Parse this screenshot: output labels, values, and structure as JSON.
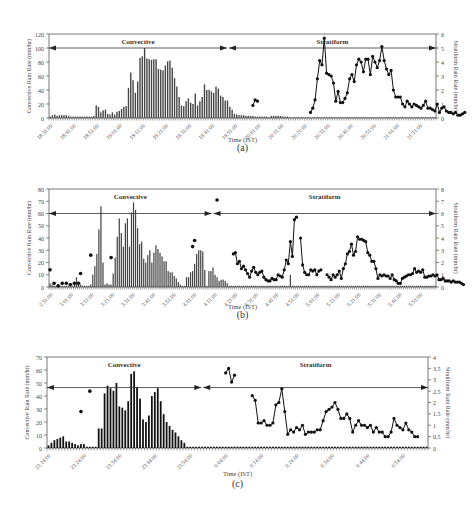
{
  "chart_data": [
    {
      "id": "a",
      "type": "bar+line",
      "panel_label": "(a)",
      "xlabel": "Time (IST)",
      "ylabel_left": "Convective Rain Rate (mm/hr)",
      "ylabel_right": "Stratiform Rain Rate (mm/hr)",
      "ylim_left": [
        0,
        120
      ],
      "yticks_left": [
        0,
        20,
        40,
        60,
        80,
        100,
        120
      ],
      "ylim_right": [
        0,
        6
      ],
      "yticks_right": [
        0,
        1,
        2,
        3,
        4,
        5,
        6
      ],
      "xtick_labels": [
        "18:31:00",
        "18:41:00",
        "18:51:00",
        "19:01:00",
        "19:11:00",
        "19:21:00",
        "19:31:00",
        "19:41:00",
        "19:51:00",
        "20:01:00",
        "20:11:00",
        "20:21:00",
        "20:31:00",
        "20:41:00",
        "20:51:00",
        "21:01:00",
        "21:11:00"
      ],
      "regions": [
        {
          "name": "Convective",
          "start_frac": 0.0,
          "end_frac": 0.46,
          "arrow_y": 100
        },
        {
          "name": "Stratiform",
          "start_frac": 0.465,
          "end_frac": 1.0,
          "arrow_y": 100
        }
      ],
      "convective_bars": [
        2,
        4,
        5,
        3,
        4,
        4,
        4,
        4,
        3,
        2,
        2,
        2,
        2,
        2,
        2,
        2,
        2,
        2,
        2,
        3,
        18,
        16,
        8,
        11,
        12,
        6,
        5,
        8,
        5,
        9,
        10,
        13,
        16,
        17,
        43,
        65,
        54,
        36,
        52,
        86,
        88,
        100,
        85,
        84,
        83,
        84,
        84,
        70,
        69,
        68,
        75,
        81,
        82,
        72,
        57,
        45,
        30,
        18,
        17,
        24,
        28,
        22,
        20,
        35,
        18,
        24,
        30,
        48,
        40,
        40,
        38,
        36,
        45,
        42,
        32,
        30,
        25,
        25,
        16,
        12,
        6,
        5,
        4,
        4,
        4,
        3,
        3,
        3,
        3,
        2,
        2,
        2,
        2,
        2,
        2,
        1,
        3,
        3,
        3,
        3,
        3,
        2,
        2,
        2,
        1,
        1,
        1,
        1,
        1,
        1,
        1,
        1,
        1,
        1,
        1,
        1,
        1,
        1,
        1,
        1,
        1,
        1,
        1,
        1,
        1,
        1,
        1,
        1,
        1,
        1,
        1,
        1,
        1,
        1,
        1,
        1,
        1,
        1,
        1,
        1,
        1,
        1,
        1,
        1,
        1,
        1,
        1,
        1,
        1,
        1,
        1,
        1,
        1,
        1,
        1,
        1,
        1,
        1,
        1,
        1,
        1,
        1,
        1,
        1,
        1,
        1,
        1,
        1
      ],
      "stratiform_line": {
        "start_index": 88,
        "values": [
          0.9,
          1.3,
          1.2,
          null,
          null,
          null,
          null,
          null,
          null,
          null,
          null,
          null,
          null,
          null,
          null,
          null,
          null,
          null,
          null,
          null,
          null,
          null,
          null,
          null,
          null,
          0.4,
          0.7,
          1.3,
          2.8,
          4.1,
          3.8,
          5.7,
          3.2,
          3.1,
          3.0,
          2.5,
          1.2,
          1.9,
          1.1,
          1.1,
          1.4,
          1.8,
          2.8,
          3.1,
          2.6,
          3.8,
          4.2,
          4.0,
          3.3,
          4.2,
          4.2,
          3.1,
          4.4,
          4.0,
          3.6,
          4.1,
          5.1,
          4.1,
          3.5,
          3.1,
          3.4,
          2.0,
          1.5,
          1.5,
          1.5,
          1.0,
          0.8,
          1.2,
          1.0,
          0.8,
          1.0,
          0.9,
          0.8,
          0.7,
          0.9,
          1.2,
          0.7,
          0.7,
          0.6,
          0.5,
          1.0,
          0.4,
          0.7,
          0.8,
          0.5,
          0.4,
          0.4,
          0.3,
          0.4,
          0.2,
          0.2,
          0.3,
          0.4
        ]
      }
    },
    {
      "id": "b",
      "type": "bar+line",
      "panel_label": "(b)",
      "xlabel": "Time (IST)",
      "ylabel_left": "Convective Rain Rate (mm/hr)",
      "ylabel_right": "Stratiform Rain Rate (mm/hr)",
      "ylim_left": [
        0,
        80
      ],
      "yticks_left": [
        0,
        10,
        20,
        30,
        40,
        50,
        60,
        70,
        80
      ],
      "ylim_right": [
        0,
        8
      ],
      "yticks_right": [
        0,
        1,
        2,
        3,
        4,
        5,
        6,
        7,
        8
      ],
      "xtick_labels": [
        "2:51:00",
        "3:01:00",
        "3:11:00",
        "3:21:00",
        "3:31:00",
        "3:41:00",
        "3:51:00",
        "4:01:00",
        "4:11:00",
        "4:21:00",
        "4:31:00",
        "4:41:00",
        "4:51:00",
        "5:01:00",
        "5:11:00",
        "5:21:00",
        "5:31:00",
        "5:41:00",
        "5:51:00"
      ],
      "regions": [
        {
          "name": "Convective",
          "start_frac": 0.0,
          "end_frac": 0.42,
          "arrow_y": 60
        },
        {
          "name": "Stratiform",
          "start_frac": 0.425,
          "end_frac": 1.0,
          "arrow_y": 60
        }
      ],
      "convective_bars": [
        3,
        2,
        1,
        1,
        1,
        1,
        1,
        1,
        1,
        1,
        1,
        1,
        2,
        8,
        3,
        2,
        1,
        1,
        1,
        1,
        2,
        10,
        17,
        27,
        47,
        66,
        20,
        2,
        3,
        2,
        2,
        11,
        24,
        41,
        56,
        44,
        33,
        52,
        56,
        33,
        61,
        69,
        63,
        48,
        35,
        37,
        23,
        20,
        26,
        30,
        20,
        28,
        34,
        31,
        28,
        25,
        21,
        21,
        13,
        12,
        12,
        9,
        7,
        4,
        2,
        1,
        1,
        8,
        8,
        12,
        13,
        19,
        27,
        30,
        30,
        29,
        14,
        1,
        13,
        13,
        16,
        10,
        8,
        5,
        6,
        6,
        5,
        3,
        1,
        1,
        1,
        1,
        1,
        1,
        1,
        1,
        1,
        1,
        1,
        1,
        1,
        1,
        1,
        1,
        1,
        1,
        1,
        1,
        1,
        1,
        1,
        1,
        1,
        1,
        1,
        1,
        1,
        1,
        10,
        1,
        1,
        1,
        1,
        1,
        1,
        1,
        1,
        1,
        1,
        1,
        1,
        1,
        1,
        1,
        1,
        1,
        1,
        1,
        1,
        1,
        1,
        1,
        1,
        1,
        1,
        1,
        1,
        1,
        1,
        1,
        1,
        1,
        1,
        1,
        1,
        1,
        1,
        1,
        1,
        1,
        1,
        1,
        1,
        1,
        1,
        1,
        1,
        1,
        1,
        1,
        1,
        1,
        1,
        1,
        1,
        1,
        1,
        1,
        1,
        1,
        1,
        1,
        1,
        1,
        1,
        1,
        1,
        1,
        1,
        1
      ],
      "isolated_points": [
        {
          "i": 0,
          "v": 1.4
        },
        {
          "i": 2,
          "v": 0.3
        },
        {
          "i": 4,
          "v": 0.1
        },
        {
          "i": 6,
          "v": 0.3
        },
        {
          "i": 8,
          "v": 0.3
        },
        {
          "i": 10,
          "v": 0.2
        },
        {
          "i": 12,
          "v": 0.3
        },
        {
          "i": 14,
          "v": 0.3
        },
        {
          "i": 15,
          "v": 1.1
        },
        {
          "i": 20,
          "v": 2.6
        },
        {
          "i": 30,
          "v": 2.4
        },
        {
          "i": 70,
          "v": 3.3
        },
        {
          "i": 71,
          "v": 3.8
        },
        {
          "i": 82,
          "v": 7.1
        }
      ],
      "stratiform_line": {
        "start_index": 90,
        "values": [
          2.7,
          2.8,
          1.9,
          2.1,
          1.5,
          1.7,
          1.4,
          1.1,
          0.8,
          1.3,
          1.6,
          1.2,
          1.0,
          1.2,
          1.3,
          0.8,
          0.6,
          0.5,
          0.5,
          0.7,
          0.6,
          0.6,
          1.0,
          0.9,
          0.8,
          1.4,
          2.2,
          1.9,
          3.7,
          2.5,
          5.5,
          5.7,
          null,
          4.0,
          1.8,
          1.2,
          1.0,
          1.0,
          1.4,
          1.3,
          1.4,
          1.0,
          1.3,
          1.4,
          null,
          null,
          1.0,
          0.8,
          0.6,
          1.0,
          0.8,
          1.0,
          1.3,
          0.7,
          1.5,
          1.9,
          2.7,
          2.9,
          3.5,
          2.6,
          2.9,
          4.1,
          3.9,
          3.9,
          3.8,
          3.7,
          2.8,
          2.6,
          2.1,
          2.1,
          1.5,
          0.7,
          1.0,
          0.9,
          1.0,
          0.9,
          0.9,
          0.7,
          1.0,
          0.6,
          0.5,
          0.3,
          0.3,
          0.7,
          0.8,
          0.9,
          1.0,
          1.0,
          1.1,
          1.5,
          1.2,
          1.3,
          1.2,
          1.4,
          0.8,
          0.8,
          0.9,
          0.9,
          1.0,
          0.9,
          1.0,
          0.6,
          0.6,
          0.7,
          0.5,
          0.5,
          0.5,
          0.4,
          0.5,
          0.4,
          0.4,
          0.4,
          0.3,
          0.2
        ]
      }
    },
    {
      "id": "c",
      "type": "bar+line",
      "panel_label": "(c)",
      "xlabel": "Time (IST)",
      "ylabel_left": "Convective Rain Rate (mm/hr)",
      "ylabel_right": "Stratiform Rain Rate (mm/hr)",
      "ylim_left": [
        0,
        70
      ],
      "yticks_left": [
        0,
        10,
        20,
        30,
        40,
        50,
        60,
        70
      ],
      "ylim_right": [
        0,
        4
      ],
      "yticks_right_labels": [
        "0",
        "0.5",
        "1",
        "1.5",
        "2",
        "2.5",
        "3",
        "3.5",
        "4"
      ],
      "yticks_right": [
        0,
        0.5,
        1,
        1.5,
        2,
        2.5,
        3,
        3.5,
        4
      ],
      "xtick_labels": [
        "23:14:00",
        "23:24:00",
        "23:34:00",
        "23:44:00",
        "23:54:00",
        "0:04:00",
        "0:14:00",
        "0:24:00",
        "0:34:00",
        "0:44:00",
        "0:54:00"
      ],
      "regions": [
        {
          "name": "Convective",
          "start_frac": 0.0,
          "end_frac": 0.405,
          "arrow_y": 46.5
        },
        {
          "name": "Stratiform",
          "start_frac": 0.41,
          "end_frac": 1.0,
          "arrow_y": 46.5
        }
      ],
      "convective_bars": [
        2,
        4,
        6,
        7,
        8,
        9,
        5,
        5,
        4,
        3,
        2,
        3,
        3,
        1,
        1,
        1,
        1,
        15,
        15,
        42,
        48,
        46,
        44,
        50,
        32,
        31,
        29,
        36,
        57,
        59,
        47,
        38,
        22,
        20,
        25,
        40,
        43,
        46,
        36,
        26,
        20,
        17,
        14,
        12,
        9,
        6,
        4,
        1,
        1,
        1,
        1,
        1,
        1,
        1,
        1,
        1,
        1,
        1,
        1,
        1,
        1,
        1,
        1,
        1,
        1,
        1,
        1,
        1,
        1,
        1,
        1,
        1,
        1,
        1,
        1,
        1,
        1,
        1,
        1,
        1,
        1,
        1,
        1,
        1,
        1,
        1,
        1,
        1,
        1,
        1,
        1,
        1,
        1,
        1,
        1,
        1,
        1,
        1,
        1,
        1,
        1,
        1,
        1,
        1,
        1,
        1,
        1,
        1,
        1,
        1,
        1,
        1,
        1,
        1,
        1,
        1,
        1,
        1,
        1,
        1,
        1,
        1,
        1,
        1,
        1,
        1,
        1,
        1,
        1
      ],
      "isolated_points": [
        {
          "i": 11,
          "v": 1.6
        },
        {
          "i": 14,
          "v": 2.5
        }
      ],
      "stratiform_line": {
        "start_index": 46,
        "values": [
          null,
          null,
          null,
          null,
          null,
          null,
          null,
          null,
          null,
          null,
          null,
          null,
          null,
          null,
          3.3,
          3.5,
          2.9,
          3.2,
          null,
          null,
          null,
          null,
          null,
          2.3,
          2.1,
          1.1,
          1.1,
          1.2,
          1.0,
          1.0,
          1.1,
          1.9,
          2.0,
          2.6,
          1.6,
          0.6,
          0.8,
          0.7,
          0.9,
          0.8,
          1.0,
          0.6,
          0.7,
          0.7,
          0.7,
          0.8,
          0.8,
          1.2,
          1.6,
          1.7,
          1.8,
          2.0,
          1.7,
          1.3,
          1.3,
          1.5,
          1.3,
          0.7,
          1.0,
          1.2,
          1.0,
          1.0,
          0.9,
          1.0,
          0.7,
          0.9,
          0.7,
          0.7,
          0.5,
          0.5,
          0.7,
          1.3,
          1.0,
          0.9,
          0.8,
          1.1,
          0.8,
          0.7,
          0.5,
          0.5
        ]
      }
    }
  ]
}
